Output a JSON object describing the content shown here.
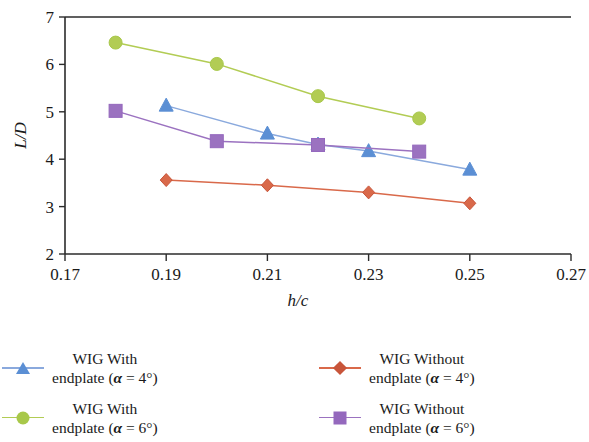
{
  "chart_data": {
    "type": "line",
    "title": "",
    "subtitle": "",
    "xlabel": "h/c",
    "ylabel": "L/D",
    "xlim": [
      0.17,
      0.27
    ],
    "ylim": [
      2,
      7
    ],
    "xticks": [
      "0.17",
      "0.19",
      "0.21",
      "0.23",
      "0.25",
      "0.27"
    ],
    "xtick_values": [
      0.17,
      0.19,
      0.21,
      0.23,
      0.25,
      0.27
    ],
    "yticks": [
      "2",
      "3",
      "4",
      "5",
      "6",
      "7"
    ],
    "ytick_values": [
      2,
      3,
      4,
      5,
      6,
      7
    ],
    "grid": false,
    "legend_position": "bottom",
    "series": [
      {
        "name": "WIG With endplate (α = 4°)",
        "color": "#8aa9dd",
        "marker": "triangle",
        "x": [
          0.19,
          0.21,
          0.22,
          0.23,
          0.25
        ],
        "values": [
          5.13,
          4.54,
          4.31,
          4.17,
          3.78
        ]
      },
      {
        "name": "WIG With endplate (α = 6°)",
        "color": "#b2cc54",
        "marker": "circle",
        "x": [
          0.18,
          0.2,
          0.22,
          0.24
        ],
        "values": [
          6.46,
          6.01,
          5.33,
          4.86
        ]
      },
      {
        "name": "WIG Without endplate (α = 4°)",
        "color": "#d9694a",
        "marker": "diamond",
        "x": [
          0.19,
          0.21,
          0.23,
          0.25
        ],
        "values": [
          3.56,
          3.45,
          3.3,
          3.07
        ]
      },
      {
        "name": "WIG Without endplate (α = 6°)",
        "color": "#9b72c0",
        "marker": "square",
        "x": [
          0.18,
          0.2,
          0.22,
          0.24
        ],
        "values": [
          5.02,
          4.38,
          4.3,
          4.16
        ]
      }
    ]
  },
  "axes": {
    "x_label": "h/c",
    "y_label": "L/D"
  },
  "legend": {
    "items": [
      {
        "line1": "WIG With",
        "line2_prefix": "endplate (",
        "alpha": "α",
        "line2_suffix": " = 4°)",
        "marker": "triangle-marker",
        "color": "#8aa9dd"
      },
      {
        "line1": "WIG Without",
        "line2_prefix": "endplate (",
        "alpha": "α",
        "line2_suffix": " = 4°)",
        "marker": "diamond-marker",
        "color": "#d9694a"
      },
      {
        "line1": "WIG With",
        "line2_prefix": "endplate (",
        "alpha": "α",
        "line2_suffix": " = 6°)",
        "marker": "circle-marker",
        "color": "#b2cc54"
      },
      {
        "line1": "WIG Without",
        "line2_prefix": "endplate (",
        "alpha": "α",
        "line2_suffix": " = 6°)",
        "marker": "square-marker",
        "color": "#9b72c0"
      }
    ]
  }
}
